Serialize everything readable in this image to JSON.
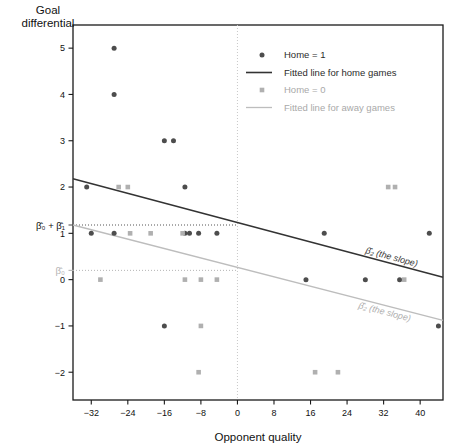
{
  "chart_data": {
    "type": "scatter",
    "title": "",
    "xlabel": "Opponent quality",
    "ylabel": "Goal differential",
    "xlim": [
      -36,
      45
    ],
    "ylim": [
      -2.6,
      5.5
    ],
    "xticks": [
      -32,
      -24,
      -16,
      -8,
      0,
      8,
      16,
      24,
      32,
      40
    ],
    "yticks": [
      5,
      4,
      3,
      2,
      1,
      0,
      -1,
      -2
    ],
    "grid": false,
    "legend_position": "top-right",
    "legend": [
      {
        "label": "Home = 1",
        "marker": "circle",
        "color": "#4d4d4d"
      },
      {
        "label": "Fitted line for home games",
        "marker": "line",
        "color": "#333333"
      },
      {
        "label": "Home = 0",
        "marker": "square",
        "color": "#b0b0b0"
      },
      {
        "label": "Fitted line for away games",
        "marker": "line",
        "color": "#bdbdbd"
      }
    ],
    "series": [
      {
        "name": "Home = 1",
        "marker": "circle",
        "color": "#4d4d4d",
        "points": [
          [
            -27,
            5
          ],
          [
            -27,
            4
          ],
          [
            -16,
            3
          ],
          [
            -14,
            3
          ],
          [
            -33,
            2
          ],
          [
            -11.5,
            2
          ],
          [
            -32,
            1
          ],
          [
            -27,
            1
          ],
          [
            -11.5,
            1
          ],
          [
            -10.5,
            1
          ],
          [
            -8.5,
            1
          ],
          [
            -4.5,
            1
          ],
          [
            19,
            1
          ],
          [
            42,
            1
          ],
          [
            15,
            0
          ],
          [
            28,
            0
          ],
          [
            35.5,
            0
          ],
          [
            -16,
            -1
          ],
          [
            44,
            -1
          ]
        ]
      },
      {
        "name": "Home = 0",
        "marker": "square",
        "color": "#b0b0b0",
        "points": [
          [
            -26,
            2
          ],
          [
            -24,
            2
          ],
          [
            33,
            2
          ],
          [
            34.5,
            2
          ],
          [
            -23.5,
            1
          ],
          [
            -19,
            1
          ],
          [
            -12,
            1
          ],
          [
            -30,
            0
          ],
          [
            -11.5,
            0
          ],
          [
            -8,
            0
          ],
          [
            -4.5,
            0
          ],
          [
            36.5,
            0
          ],
          [
            -8,
            -1
          ],
          [
            -8.5,
            -2
          ],
          [
            17,
            -2
          ],
          [
            22,
            -2
          ]
        ]
      }
    ],
    "fitted_lines": [
      {
        "name": "Fitted line for home games",
        "color": "#333333",
        "x0": -36,
        "y0": 2.18,
        "x1": 45,
        "y1": 0.05,
        "annotation": "β̂₂ (the slope)"
      },
      {
        "name": "Fitted line for away games",
        "color": "#bdbdbd",
        "x0": -36,
        "y0": 1.18,
        "x1": 45,
        "y1": -0.88,
        "annotation": "β̂₂ (the slope)"
      }
    ],
    "reference_lines": [
      {
        "name": "beta0-plus-beta1",
        "type": "horizontal",
        "y": 1.18,
        "label": "β̂₀ + β̂₁",
        "color": "#555555",
        "from_x": -36,
        "to_x": 0
      },
      {
        "name": "beta0",
        "type": "horizontal",
        "y": 0.2,
        "label": "β̂₀",
        "color": "#b4b4b4",
        "from_x": -36,
        "to_x": 0
      },
      {
        "name": "zero-vertical",
        "type": "vertical",
        "x": 0,
        "label": "",
        "color": "#c8c8c8"
      }
    ],
    "annotations": [
      {
        "name": "slope-home",
        "text": "β̂₂ (the slope)",
        "color": "#3a3a3a"
      },
      {
        "name": "slope-away",
        "text": "β̂₂ (the slope)",
        "color": "#b0b0b0"
      }
    ]
  }
}
